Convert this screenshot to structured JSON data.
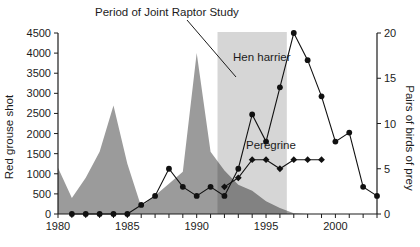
{
  "chart_data": {
    "type": "area+line",
    "title": "Period of Joint Raptor Study",
    "x_axis": {
      "range": [
        1980,
        2003
      ],
      "ticks_labeled": [
        1980,
        1985,
        1990,
        1995,
        2000
      ],
      "minor_tick_every": 1
    },
    "left_axis": {
      "label": "Red grouse shot",
      "range": [
        0,
        4500
      ],
      "tick_step": 500
    },
    "right_axis": {
      "label": "Pairs of birds of prey",
      "range": [
        0,
        20
      ],
      "tick_step": 5
    },
    "study_band": {
      "label": "Period of Joint Raptor Study",
      "x_start": 1991.5,
      "x_end": 1996.5,
      "overlay_color": "rgba(0,0,0,0.16)"
    },
    "series": [
      {
        "name": "Red grouse shot",
        "type": "area",
        "axis": "left",
        "color": "#9b9b9b",
        "x": [
          1980,
          1981,
          1982,
          1983,
          1984,
          1985,
          1986,
          1987,
          1988,
          1989,
          1990,
          1991,
          1992,
          1993,
          1994,
          1995,
          1996,
          1997,
          1998
        ],
        "values": [
          1150,
          400,
          900,
          1550,
          2700,
          1250,
          180,
          460,
          750,
          1050,
          4000,
          1550,
          1080,
          730,
          580,
          320,
          150,
          20,
          0
        ]
      },
      {
        "name": "Hen harrier",
        "type": "line",
        "axis": "right",
        "marker": "circle",
        "color": "#111111",
        "x": [
          1981,
          1982,
          1983,
          1984,
          1985,
          1986,
          1987,
          1988,
          1989,
          1990,
          1991,
          1992,
          1993,
          1994,
          1995,
          1996,
          1997,
          1998,
          1999,
          2000,
          2001,
          2002,
          2003
        ],
        "values": [
          0,
          0,
          0,
          0,
          0,
          1,
          2,
          5,
          3,
          2,
          3,
          2,
          5,
          11,
          8,
          14,
          20,
          17,
          13,
          8,
          9,
          3,
          2
        ]
      },
      {
        "name": "Peregrine",
        "type": "line",
        "axis": "right",
        "marker": "diamond",
        "color": "#111111",
        "x": [
          1992,
          1993,
          1994,
          1995,
          1996,
          1997,
          1998,
          1999
        ],
        "values": [
          3,
          4,
          6,
          6,
          5,
          6,
          6,
          6
        ]
      }
    ],
    "legend_position": "annotations-inline",
    "grid": false
  }
}
